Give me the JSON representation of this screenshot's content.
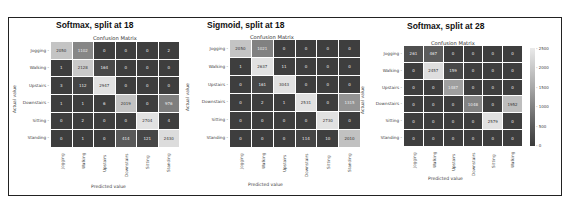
{
  "chart_data": [
    {
      "type": "heatmap",
      "panel_title": "Softmax, split at 18",
      "title": "Confusion Matrix",
      "xlabel": "Predicted value",
      "ylabel": "Actual value",
      "categories": [
        "Jogging",
        "Walking",
        "Upstairs",
        "Downstairs",
        "Sitting",
        "Standing"
      ],
      "values": [
        [
          2050,
          1102,
          0,
          0,
          0,
          2
        ],
        [
          1,
          2128,
          164,
          0,
          0,
          0
        ],
        [
          3,
          112,
          2947,
          0,
          0,
          0
        ],
        [
          1,
          1,
          6,
          2019,
          0,
          976
        ],
        [
          0,
          2,
          0,
          0,
          2704,
          4
        ],
        [
          0,
          1,
          0,
          414,
          121,
          2430
        ]
      ]
    },
    {
      "type": "heatmap",
      "panel_title": "Sigmoid, split at 18",
      "title": "Confusion Matrix",
      "xlabel": "Predicted value",
      "ylabel": "Actual value",
      "categories": [
        "Jogging",
        "Walking",
        "Upstairs",
        "Downstairs",
        "Sitting",
        "Standing"
      ],
      "values": [
        [
          2050,
          1021,
          0,
          0,
          0,
          0
        ],
        [
          1,
          2637,
          11,
          0,
          0,
          0
        ],
        [
          0,
          161,
          3043,
          0,
          0,
          0
        ],
        [
          0,
          2,
          1,
          2531,
          0,
          1315
        ],
        [
          0,
          0,
          0,
          0,
          2730,
          0
        ],
        [
          0,
          0,
          0,
          114,
          10,
          2010
        ]
      ]
    },
    {
      "type": "heatmap",
      "panel_title": "Softmax, split at 28",
      "title": "Confusion Matrix",
      "xlabel": "Predicted value",
      "ylabel": "Actual value",
      "categories": [
        "Jogging",
        "Walking",
        "Upstairs",
        "Downstairs",
        "Sitting",
        "Standing"
      ],
      "x_categories": [
        "Jogging",
        "Walking",
        "Upstairs",
        "Downstairs",
        "Sitting",
        "Walking"
      ],
      "values": [
        [
          261,
          467,
          0,
          0,
          0,
          0
        ],
        [
          0,
          2457,
          159,
          0,
          0,
          0
        ],
        [
          0,
          0,
          1487,
          0,
          0,
          0
        ],
        [
          0,
          0,
          0,
          1048,
          0,
          1952
        ],
        [
          0,
          0,
          0,
          0,
          2579,
          0
        ],
        [
          0,
          0,
          0,
          0,
          0,
          0
        ]
      ],
      "colorbar": {
        "ticks": [
          "2500",
          "2000",
          "1500",
          "1000",
          "500",
          "0"
        ],
        "range": [
          0,
          2500
        ]
      }
    }
  ]
}
